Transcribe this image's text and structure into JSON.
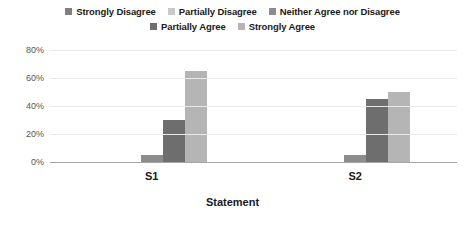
{
  "chart_data": {
    "type": "bar",
    "title": "",
    "subtitle": "",
    "xlabel": "Statement",
    "ylabel": "",
    "categories": [
      "S1",
      "S2"
    ],
    "ylim": [
      0,
      80
    ],
    "yticks": [
      0,
      20,
      40,
      60,
      80
    ],
    "ytick_labels": [
      "0%",
      "20%",
      "40%",
      "60%",
      "80%"
    ],
    "grid": true,
    "legend_position": "top",
    "series": [
      {
        "name": "Strongly Disagree",
        "values": [
          0,
          0
        ],
        "color": "#7f7f7f"
      },
      {
        "name": "Partially Disagree",
        "values": [
          0,
          0
        ],
        "color": "#c9c9c9"
      },
      {
        "name": "Neither Agree nor Disagree",
        "values": [
          5,
          5
        ],
        "color": "#8c8c8c"
      },
      {
        "name": "Partially Agree",
        "values": [
          30,
          45
        ],
        "color": "#6e6e6e"
      },
      {
        "name": "Strongly Agree",
        "values": [
          65,
          50
        ],
        "color": "#b5b5b5"
      }
    ]
  },
  "axis": {
    "x_title": "Statement"
  }
}
